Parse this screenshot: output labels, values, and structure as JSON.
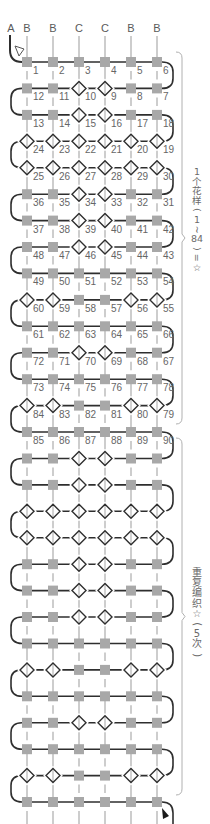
{
  "diagram": {
    "column_labels": [
      "A",
      "B",
      "B",
      "C",
      "C",
      "B",
      "B"
    ],
    "stitch_legend": {
      "S": "square-stitch",
      "D": "diamond-stitch"
    },
    "rows": [
      {
        "stitches": [
          "S",
          "S",
          "S",
          "S",
          "S",
          "S"
        ],
        "numbers": [
          1,
          2,
          3,
          4,
          5,
          6
        ]
      },
      {
        "stitches": [
          "S",
          "S",
          "D",
          "D",
          "S",
          "S"
        ],
        "numbers": [
          12,
          11,
          10,
          9,
          8,
          7
        ]
      },
      {
        "stitches": [
          "S",
          "S",
          "D",
          "D",
          "S",
          "S"
        ],
        "numbers": [
          13,
          14,
          15,
          16,
          17,
          18
        ]
      },
      {
        "stitches": [
          "D",
          "D",
          "D",
          "D",
          "D",
          "D"
        ],
        "numbers": [
          24,
          23,
          22,
          21,
          20,
          19
        ]
      },
      {
        "stitches": [
          "D",
          "D",
          "D",
          "D",
          "D",
          "D"
        ],
        "numbers": [
          25,
          26,
          27,
          28,
          29,
          30
        ]
      },
      {
        "stitches": [
          "S",
          "S",
          "D",
          "D",
          "S",
          "S"
        ],
        "numbers": [
          36,
          35,
          34,
          33,
          32,
          31
        ]
      },
      {
        "stitches": [
          "S",
          "S",
          "D",
          "D",
          "S",
          "S"
        ],
        "numbers": [
          37,
          38,
          39,
          40,
          41,
          42
        ]
      },
      {
        "stitches": [
          "S",
          "S",
          "D",
          "D",
          "S",
          "S"
        ],
        "numbers": [
          48,
          47,
          46,
          45,
          44,
          43
        ]
      },
      {
        "stitches": [
          "S",
          "S",
          "S",
          "S",
          "S",
          "S"
        ],
        "numbers": [
          49,
          50,
          51,
          52,
          53,
          54
        ]
      },
      {
        "stitches": [
          "D",
          "D",
          "S",
          "S",
          "D",
          "D"
        ],
        "numbers": [
          60,
          59,
          58,
          57,
          56,
          55
        ]
      },
      {
        "stitches": [
          "S",
          "S",
          "S",
          "S",
          "S",
          "S"
        ],
        "numbers": [
          61,
          62,
          63,
          64,
          65,
          66
        ]
      },
      {
        "stitches": [
          "S",
          "S",
          "D",
          "D",
          "S",
          "S"
        ],
        "numbers": [
          72,
          71,
          70,
          69,
          68,
          67
        ]
      },
      {
        "stitches": [
          "S",
          "S",
          "S",
          "S",
          "S",
          "S"
        ],
        "numbers": [
          73,
          74,
          75,
          76,
          77,
          78
        ]
      },
      {
        "stitches": [
          "D",
          "D",
          "S",
          "S",
          "D",
          "D"
        ],
        "numbers": [
          84,
          83,
          82,
          81,
          80,
          79
        ]
      },
      {
        "stitches": [
          "S",
          "S",
          "S",
          "S",
          "S",
          "S"
        ],
        "numbers": [
          85,
          86,
          87,
          88,
          89,
          90
        ]
      },
      {
        "stitches": [
          "S",
          "S",
          "D",
          "D",
          "S",
          "S"
        ]
      },
      {
        "stitches": [
          "S",
          "S",
          "D",
          "D",
          "S",
          "S"
        ]
      },
      {
        "stitches": [
          "D",
          "D",
          "D",
          "D",
          "D",
          "D"
        ]
      },
      {
        "stitches": [
          "D",
          "D",
          "D",
          "D",
          "D",
          "D"
        ]
      },
      {
        "stitches": [
          "S",
          "S",
          "D",
          "D",
          "S",
          "S"
        ]
      },
      {
        "stitches": [
          "S",
          "S",
          "D",
          "D",
          "S",
          "S"
        ]
      },
      {
        "stitches": [
          "S",
          "S",
          "D",
          "D",
          "S",
          "S"
        ]
      },
      {
        "stitches": [
          "S",
          "S",
          "S",
          "S",
          "S",
          "S"
        ]
      },
      {
        "stitches": [
          "D",
          "D",
          "S",
          "S",
          "D",
          "D"
        ]
      },
      {
        "stitches": [
          "S",
          "S",
          "S",
          "S",
          "S",
          "S"
        ]
      },
      {
        "stitches": [
          "S",
          "S",
          "D",
          "D",
          "S",
          "S"
        ]
      },
      {
        "stitches": [
          "S",
          "S",
          "S",
          "S",
          "S",
          "S"
        ]
      },
      {
        "stitches": [
          "D",
          "D",
          "S",
          "S",
          "D",
          "D"
        ]
      },
      {
        "stitches": [
          "S",
          "S",
          "S",
          "S",
          "S",
          "S"
        ]
      }
    ],
    "start_marker": "open-triangle-icon",
    "end_marker": "filled-arrow-icon"
  },
  "annotations": [
    {
      "text": "1个花样(1~84)=☆",
      "glyphs": [
        "1",
        "个",
        "花",
        "样",
        "(",
        "1",
        "~",
        "84",
        ")",
        "=",
        "☆"
      ]
    },
    {
      "text": "重复编织☆(5次)",
      "glyphs": [
        "重",
        "复",
        "编",
        "织",
        "☆",
        "(",
        "5",
        "次",
        ")"
      ]
    }
  ],
  "colors": {
    "background": "#ffffff",
    "thread": "#2e2e2e",
    "square": "#a8a8a8",
    "guide": "#bcbcbc",
    "diamond_outline": "#2e2e2e",
    "brace": "#b0b0b0",
    "end_arrow": "#1a1a1a"
  }
}
